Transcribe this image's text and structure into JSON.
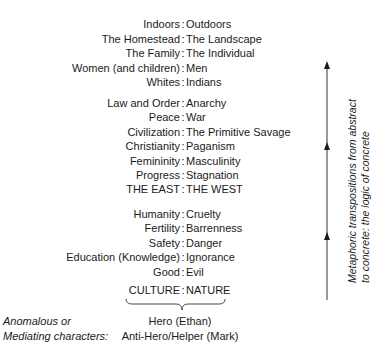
{
  "diagram": {
    "groups": [
      {
        "rows": [
          {
            "left": "Indoors",
            "right": "Outdoors"
          },
          {
            "left": "The Homestead",
            "right": "The Landscape"
          },
          {
            "left": "The Family",
            "right": "The Individual"
          },
          {
            "left": "Women (and children)",
            "right": "Men"
          },
          {
            "left": "Whites",
            "right": "Indians"
          }
        ]
      },
      {
        "rows": [
          {
            "left": "Law and Order",
            "right": "Anarchy"
          },
          {
            "left": "Peace",
            "right": "War"
          },
          {
            "left": "Civilization",
            "right": "The Primitive Savage"
          },
          {
            "left": "Christianity",
            "right": "Paganism"
          },
          {
            "left": "Femininity",
            "right": "Masculinity"
          },
          {
            "left": "Progress",
            "right": "Stagnation"
          },
          {
            "left": "THE EAST",
            "right": "THE WEST"
          }
        ]
      },
      {
        "rows": [
          {
            "left": "Humanity",
            "right": "Cruelty"
          },
          {
            "left": "Fertility",
            "right": "Barrenness"
          },
          {
            "left": "Safety",
            "right": "Danger"
          },
          {
            "left": "Education (Knowledge)",
            "right": "Ignorance"
          },
          {
            "left": "Good",
            "right": "Evil"
          }
        ]
      }
    ],
    "separator": ":",
    "base_pair": {
      "left": "CULTURE",
      "right": "NATURE"
    },
    "mediating": {
      "label_line1": "Anomalous or",
      "label_line2": "Mediating characters:",
      "characters": [
        "Hero (Ethan)",
        "Anti-Hero/Helper (Mark)"
      ]
    },
    "axis_label": {
      "line1": "Metaphoric transpositions from abstract",
      "line2": "to concrete: the logic of concrete"
    },
    "colors": {
      "text": "#1a1a1a",
      "lines": "#333333",
      "background": "#ffffff"
    }
  }
}
